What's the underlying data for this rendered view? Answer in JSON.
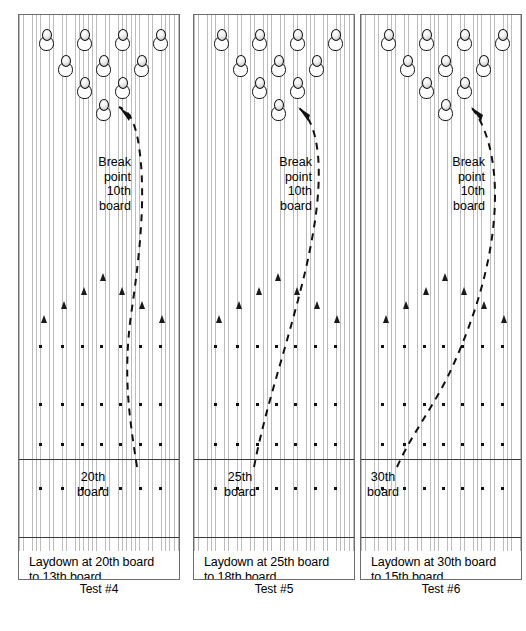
{
  "diagram": {
    "lane_count": 3,
    "board_stripe_color": "#bdbdbd",
    "ink_color": "#111111"
  },
  "break_point_label": {
    "line1": "Break",
    "line2": "point",
    "line3": "10th",
    "line4": "board"
  },
  "lanes": [
    {
      "id": "test-4",
      "test_label": "Test #4",
      "caption_line1": "Laydown at 20th board",
      "caption_line2": "to 13th board.",
      "board_marker": "20th",
      "board_marker_line2": "board",
      "laydown_board": 20,
      "target_board": 13,
      "break_point_board": 10
    },
    {
      "id": "test-5",
      "test_label": "Test #5",
      "caption_line1": "Laydown at 25th board",
      "caption_line2": "to 18th board.",
      "board_marker": "25th",
      "board_marker_line2": "board",
      "laydown_board": 25,
      "target_board": 18,
      "break_point_board": 10
    },
    {
      "id": "test-6",
      "test_label": "Test #6",
      "caption_line1": "Laydown at 30th board",
      "caption_line2": "to 15th board.",
      "board_marker": "30th",
      "board_marker_line2": "board",
      "laydown_board": 30,
      "target_board": 15,
      "break_point_board": 10
    }
  ],
  "pin_layout": {
    "description": "standard 10-pin triangle",
    "rows": [
      {
        "count": 4,
        "xs": [
          20,
          58,
          96,
          134
        ],
        "y": 14
      },
      {
        "count": 3,
        "xs": [
          39,
          77,
          115
        ],
        "y": 40
      },
      {
        "count": 2,
        "xs": [
          58,
          96
        ],
        "y": 62
      },
      {
        "count": 1,
        "xs": [
          77
        ],
        "y": 84
      }
    ]
  },
  "arrow_markers": {
    "count": 7,
    "xs": [
      22,
      42,
      62,
      81,
      100,
      120,
      140
    ],
    "ys": [
      300,
      286,
      272,
      258,
      272,
      286,
      300
    ]
  },
  "dot_rows": {
    "xs": [
      20,
      42,
      62,
      81,
      100,
      120,
      140
    ],
    "ys": [
      330,
      388,
      428,
      472
    ]
  }
}
